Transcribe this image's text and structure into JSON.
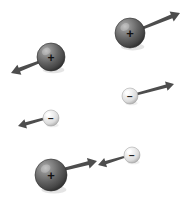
{
  "figure": {
    "background_color": "#ffffff",
    "width": 195,
    "height": 197,
    "positive_sign": "+",
    "negative_sign": "−",
    "positive_color": "#5a5a5a",
    "positive_highlight_color": "#a8a8a8",
    "positive_edge_color": "#2e2e2e",
    "negative_color": "#e2e2e2",
    "negative_highlight_color": "#fbfbfb",
    "negative_edge_color": "#9a9a9a",
    "sign_color_positive": "#111111",
    "sign_color_negative": "#222222",
    "arrow_color": "#4d4d4d"
  },
  "particles": [
    {
      "id": "positive-upper-right",
      "charge": "positive",
      "sign": "+",
      "cx": 130,
      "cy": 33,
      "r": 15,
      "sign_size": 13,
      "arrow": {
        "x1": 143,
        "y1": 28,
        "x2": 180,
        "y2": 13,
        "head": 9,
        "width": 3.2,
        "direction": "up-right"
      }
    },
    {
      "id": "positive-upper-left",
      "charge": "positive",
      "sign": "+",
      "cx": 51,
      "cy": 57,
      "r": 14,
      "sign_size": 12,
      "arrow": {
        "x1": 39,
        "y1": 62,
        "x2": 11,
        "y2": 73,
        "head": 9,
        "width": 3.2,
        "direction": "down-left"
      }
    },
    {
      "id": "negative-middle-right",
      "charge": "negative",
      "sign": "−",
      "cx": 130,
      "cy": 96,
      "r": 8,
      "sign_size": 10,
      "arrow": {
        "x1": 137,
        "y1": 94,
        "x2": 174,
        "y2": 84,
        "head": 8,
        "width": 2.6,
        "direction": "up-right"
      }
    },
    {
      "id": "negative-middle-left",
      "charge": "negative",
      "sign": "−",
      "cx": 51,
      "cy": 118,
      "r": 8,
      "sign_size": 10,
      "arrow": {
        "x1": 43,
        "y1": 119,
        "x2": 18,
        "y2": 126,
        "head": 8,
        "width": 2.6,
        "direction": "left"
      }
    },
    {
      "id": "negative-bottom-right",
      "charge": "negative",
      "sign": "−",
      "cx": 132,
      "cy": 155,
      "r": 8,
      "sign_size": 10,
      "arrow": {
        "x1": 124,
        "y1": 157,
        "x2": 98,
        "y2": 165,
        "head": 8,
        "width": 2.6,
        "direction": "left"
      }
    },
    {
      "id": "positive-bottom-left",
      "charge": "positive",
      "sign": "+",
      "cx": 51,
      "cy": 175,
      "r": 16,
      "sign_size": 13,
      "arrow": {
        "x1": 65,
        "y1": 169,
        "x2": 97,
        "y2": 161,
        "head": 9,
        "width": 3.2,
        "direction": "right"
      }
    }
  ]
}
